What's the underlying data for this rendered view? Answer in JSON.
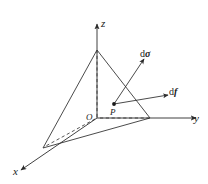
{
  "figure": {
    "background_color": "#ffffff",
    "line_color": "#2b2b2b",
    "axes": [
      {
        "name": "z-axis",
        "label": "z",
        "direction": "up"
      },
      {
        "name": "y-axis",
        "label": "y",
        "direction": "right"
      },
      {
        "name": "x-axis",
        "label": "x",
        "direction": "lower-left"
      }
    ],
    "points": [
      {
        "name": "origin",
        "label": "O"
      },
      {
        "name": "point-p",
        "label": "P"
      }
    ],
    "vectors": [
      {
        "name": "d-sigma-vector",
        "label_prefix": "d",
        "label_symbol": "σ",
        "direction": "upper-right"
      },
      {
        "name": "df-vector",
        "label_prefix": "d",
        "label_symbol": "f",
        "direction": "right"
      }
    ],
    "shape": {
      "name": "tetrahedron",
      "solid_edges": 5,
      "dashed_edges": 3
    }
  }
}
